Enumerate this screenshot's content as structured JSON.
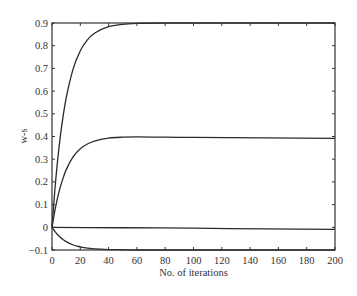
{
  "chart_data": {
    "type": "line",
    "title": "",
    "xlabel": "No. of iterations",
    "ylabel": "w-s",
    "xlim": [
      0,
      200
    ],
    "ylim": [
      -0.1,
      0.9
    ],
    "xticks": [
      0,
      20,
      40,
      60,
      80,
      100,
      120,
      140,
      160,
      180,
      200
    ],
    "yticks": [
      -0.1,
      0,
      0.1,
      0.2,
      0.3,
      0.4,
      0.5,
      0.6,
      0.7,
      0.8,
      0.9
    ],
    "ytick_labels": [
      "−0.1",
      "0",
      "0.1",
      "0.2",
      "0.3",
      "0.4",
      "0.5",
      "0.6",
      "0.7",
      "0.8",
      "0.9"
    ],
    "grid": false,
    "legend": null,
    "series": [
      {
        "name": "w-s component 1",
        "x": [
          0,
          2,
          4,
          6,
          8,
          10,
          15,
          20,
          25,
          30,
          40,
          50,
          60,
          80,
          100,
          150,
          200
        ],
        "values": [
          0,
          0.163,
          0.297,
          0.406,
          0.496,
          0.569,
          0.699,
          0.778,
          0.826,
          0.855,
          0.884,
          0.894,
          0.898,
          0.9,
          0.9,
          0.9,
          0.9
        ]
      },
      {
        "name": "w-s component 2",
        "x": [
          0,
          2,
          4,
          6,
          8,
          10,
          15,
          20,
          25,
          30,
          40,
          50,
          60,
          80,
          100,
          150,
          200
        ],
        "values": [
          0,
          0.072,
          0.132,
          0.18,
          0.22,
          0.253,
          0.311,
          0.346,
          0.367,
          0.38,
          0.393,
          0.397,
          0.398,
          0.397,
          0.396,
          0.394,
          0.392
        ]
      },
      {
        "name": "w-s component 3",
        "x": [
          0,
          50,
          100,
          150,
          200
        ],
        "values": [
          0,
          -0.002,
          -0.004,
          -0.007,
          -0.009
        ]
      },
      {
        "name": "w-s component 4",
        "x": [
          0,
          2,
          4,
          6,
          8,
          10,
          15,
          20,
          25,
          30,
          40,
          50,
          60,
          80,
          100,
          150,
          200
        ],
        "values": [
          0,
          -0.018,
          -0.033,
          -0.045,
          -0.055,
          -0.063,
          -0.078,
          -0.086,
          -0.092,
          -0.095,
          -0.098,
          -0.099,
          -0.1,
          -0.1,
          -0.1,
          -0.1,
          -0.1
        ]
      }
    ]
  }
}
